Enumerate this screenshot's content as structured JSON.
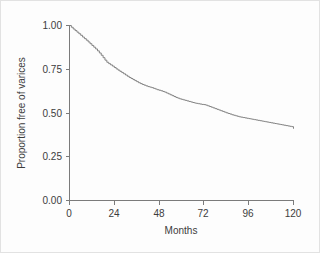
{
  "figure": {
    "background_color": "#ffffff",
    "border_color": "#e2e2e2",
    "curve_color": "#838383",
    "axis_color": "#7b7b7b",
    "text_color": "#3c3c3c"
  },
  "chart_data": {
    "type": "line",
    "title": "",
    "subtitle": "",
    "xlabel": "Months",
    "ylabel": "Proportion free of varices",
    "xlim": [
      0,
      120
    ],
    "ylim": [
      0.0,
      1.0
    ],
    "xticks": [
      0,
      24,
      48,
      72,
      96,
      120
    ],
    "xtick_labels": [
      "0",
      "24",
      "48",
      "72",
      "96",
      "120"
    ],
    "yticks": [
      0.0,
      0.25,
      0.5,
      0.75,
      1.0
    ],
    "ytick_labels": [
      "0.00",
      "0.25",
      "0.50",
      "0.75",
      "1.00"
    ],
    "grid": false,
    "legend": null,
    "legend_position": "none",
    "annotations": [],
    "series": [
      {
        "name": "Proportion free of varices",
        "step": "post",
        "x": [
          0,
          1,
          2,
          3,
          4,
          5,
          6,
          7,
          8,
          9,
          10,
          11,
          12,
          13,
          14,
          15,
          16,
          17,
          18,
          19,
          20,
          21,
          22,
          23,
          24,
          25,
          26,
          27,
          28,
          29,
          30,
          31,
          32,
          33,
          34,
          35,
          36,
          37,
          38,
          39,
          40,
          41,
          42,
          43,
          44,
          45,
          46,
          47,
          48,
          49,
          50,
          51,
          52,
          53,
          54,
          55,
          56,
          57,
          58,
          59,
          60,
          61,
          62,
          63,
          64,
          65,
          66,
          67,
          68,
          69,
          70,
          71,
          72,
          73,
          74,
          75,
          76,
          77,
          78,
          79,
          80,
          81,
          82,
          83,
          84,
          85,
          86,
          87,
          88,
          89,
          90,
          91,
          92,
          93,
          94,
          95,
          96,
          97,
          98,
          99,
          100,
          101,
          102,
          103,
          104,
          105,
          106,
          107,
          108,
          109,
          110,
          111,
          112,
          113,
          114,
          115,
          116,
          117,
          118,
          119,
          120
        ],
        "y": [
          1.0,
          0.99,
          0.98,
          0.971,
          0.962,
          0.953,
          0.944,
          0.934,
          0.925,
          0.916,
          0.906,
          0.896,
          0.886,
          0.876,
          0.866,
          0.855,
          0.843,
          0.83,
          0.816,
          0.802,
          0.79,
          0.782,
          0.775,
          0.768,
          0.76,
          0.752,
          0.745,
          0.738,
          0.731,
          0.724,
          0.717,
          0.71,
          0.703,
          0.697,
          0.691,
          0.685,
          0.679,
          0.673,
          0.668,
          0.663,
          0.659,
          0.655,
          0.651,
          0.648,
          0.645,
          0.641,
          0.637,
          0.633,
          0.63,
          0.627,
          0.623,
          0.619,
          0.614,
          0.609,
          0.604,
          0.599,
          0.594,
          0.589,
          0.585,
          0.581,
          0.578,
          0.575,
          0.572,
          0.569,
          0.566,
          0.563,
          0.56,
          0.557,
          0.555,
          0.553,
          0.551,
          0.549,
          0.548,
          0.545,
          0.541,
          0.537,
          0.533,
          0.529,
          0.525,
          0.521,
          0.517,
          0.513,
          0.509,
          0.505,
          0.501,
          0.497,
          0.494,
          0.49,
          0.487,
          0.484,
          0.481,
          0.478,
          0.476,
          0.474,
          0.472,
          0.47,
          0.468,
          0.466,
          0.464,
          0.462,
          0.46,
          0.458,
          0.456,
          0.454,
          0.452,
          0.45,
          0.448,
          0.446,
          0.444,
          0.442,
          0.44,
          0.438,
          0.436,
          0.434,
          0.432,
          0.43,
          0.428,
          0.426,
          0.424,
          0.422,
          0.41
        ]
      }
    ]
  }
}
